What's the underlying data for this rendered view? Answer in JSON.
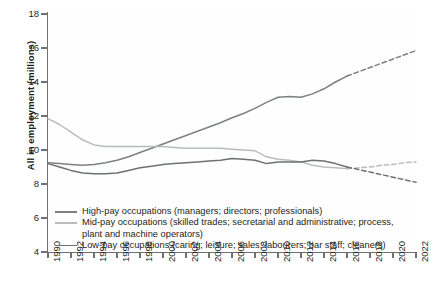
{
  "axes": {
    "ylabel": "All in employment (millions)",
    "yticks": [
      4,
      6,
      8,
      10,
      12,
      14,
      16,
      18
    ],
    "xticks": [
      1990,
      1992,
      1994,
      1996,
      1998,
      2000,
      2002,
      2004,
      2006,
      2008,
      2010,
      2012,
      2014,
      2016,
      2018,
      2020,
      2022
    ]
  },
  "legend": [
    {
      "label": "High-pay occupations (managers; directors; professionals)",
      "color": "#7d8083"
    },
    {
      "label": "Mid-pay occupations (skilled trades; secretarial and administrative; process, plant and machine operators)",
      "color": "#b9bcbe"
    },
    {
      "label": "Low-pay occupations (caring; leisure; sales; labourers; bar staff; cleaners)",
      "color": "#6e7markers"
    }
  ],
  "chart_data": {
    "type": "line",
    "title": "",
    "xlabel": "",
    "ylabel": "All in employment (millions)",
    "xlim": [
      1990,
      2022
    ],
    "ylim": [
      4,
      18
    ],
    "grid": false,
    "legend_position": "inside-bottom-left",
    "x": [
      1990,
      1991,
      1992,
      1993,
      1994,
      1995,
      1996,
      1997,
      1998,
      1999,
      2000,
      2001,
      2002,
      2003,
      2004,
      2005,
      2006,
      2007,
      2008,
      2009,
      2010,
      2011,
      2012,
      2013,
      2014,
      2015,
      2016,
      2017,
      2018,
      2019,
      2020,
      2021,
      2022
    ],
    "series": [
      {
        "name": "High-pay occupations (managers; directors; professionals)",
        "color": "#7d8083",
        "solid_until": 2016,
        "dashed_from": 2016,
        "values": [
          9.25,
          9.2,
          9.15,
          9.1,
          9.15,
          9.25,
          9.4,
          9.6,
          9.85,
          10.1,
          10.35,
          10.6,
          10.85,
          11.1,
          11.35,
          11.6,
          11.9,
          12.15,
          12.45,
          12.8,
          13.1,
          13.15,
          13.1,
          13.3,
          13.6,
          14.0,
          14.35,
          14.6,
          14.85,
          15.1,
          15.35,
          15.6,
          15.85
        ]
      },
      {
        "name": "Mid-pay occupations (skilled trades; secretarial and administrative; process, plant and machine operators)",
        "color": "#b9bcbe",
        "solid_until": 2016,
        "dashed_from": 2016,
        "values": [
          11.85,
          11.5,
          11.05,
          10.6,
          10.3,
          10.2,
          10.2,
          10.2,
          10.2,
          10.2,
          10.2,
          10.15,
          10.1,
          10.1,
          10.1,
          10.1,
          10.05,
          10.0,
          9.95,
          9.6,
          9.45,
          9.4,
          9.3,
          9.1,
          9.0,
          8.95,
          8.9,
          8.95,
          9.0,
          9.1,
          9.15,
          9.25,
          9.3
        ]
      },
      {
        "name": "Low-pay occupations (caring; leisure; sales; labourers; bar staff; cleaners)",
        "color": "#6e7174",
        "solid_until": 2016,
        "dashed_from": 2016,
        "values": [
          9.2,
          9.0,
          8.8,
          8.65,
          8.6,
          8.6,
          8.65,
          8.8,
          8.95,
          9.05,
          9.15,
          9.2,
          9.25,
          9.3,
          9.35,
          9.4,
          9.5,
          9.45,
          9.4,
          9.2,
          9.3,
          9.3,
          9.3,
          9.4,
          9.35,
          9.2,
          9.0,
          8.85,
          8.7,
          8.55,
          8.4,
          8.25,
          8.1
        ]
      }
    ]
  }
}
